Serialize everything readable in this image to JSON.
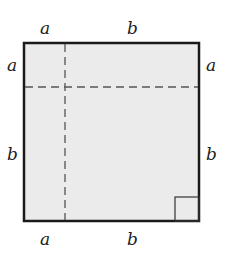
{
  "diagram": {
    "type": "square-partition",
    "labels": {
      "top": [
        "a",
        "b"
      ],
      "bottom": [
        "a",
        "b"
      ],
      "left": [
        "a",
        "b"
      ],
      "right": [
        "a",
        "b"
      ]
    },
    "colors": {
      "fill": "#ebebeb",
      "border": "#1a1a1a",
      "dash": "#555555"
    }
  }
}
